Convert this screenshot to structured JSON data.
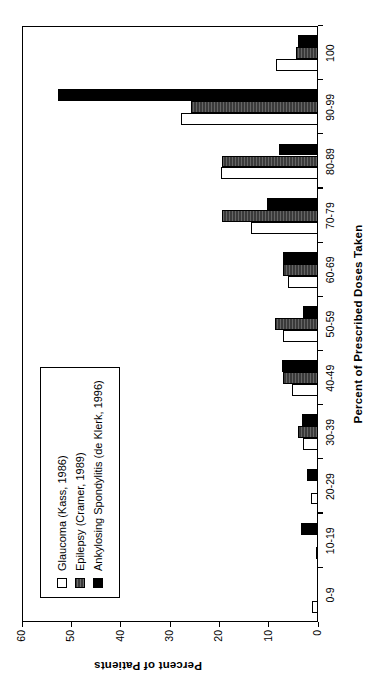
{
  "chart_data": {
    "type": "bar",
    "title": "",
    "xlabel": "Percent of Prescribed Doses Taken",
    "ylabel": "Percent of Patients",
    "ylim": [
      0,
      60
    ],
    "yticks": [
      0,
      10,
      20,
      30,
      40,
      50,
      60
    ],
    "grid": false,
    "legend_position": "inside-upper-left",
    "orientation": "vertical-bars-rotated-90",
    "categories": [
      "0-9",
      "10-19",
      "20-29",
      "30-39",
      "40-49",
      "50-59",
      "60-69",
      "70-79",
      "80-89",
      "90-99",
      "100"
    ],
    "series": [
      {
        "name": "Glaucoma (Kass, 1986)",
        "style": "open-white",
        "color": "#ffffff",
        "values": [
          1.2,
          0.5,
          1.5,
          3.0,
          5.2,
          7.0,
          6.0,
          13.5,
          19.7,
          27.7,
          8.5
        ]
      },
      {
        "name": "Epilepsy (Cramer, 1989)",
        "style": "dark-hatched",
        "color": "#3a3a3a",
        "values": [
          0,
          0,
          0,
          4.0,
          7.0,
          8.7,
          7.0,
          19.5,
          19.5,
          25.7,
          4.5
        ]
      },
      {
        "name": "Ankylosing Spondylitis (de Klerk, 1996)",
        "style": "solid-black",
        "color": "#000000",
        "values": [
          0,
          3.5,
          2.3,
          3.3,
          7.2,
          3.0,
          7.0,
          10.3,
          8.0,
          52.8,
          4.0
        ]
      }
    ]
  },
  "axes": {
    "y_tick_labels": [
      "0",
      "10",
      "20",
      "30",
      "40",
      "50",
      "60"
    ],
    "y_axis_title": "Percent of Patients",
    "x_axis_title": "Percent of Prescribed Doses Taken",
    "x_tick_labels": [
      "0-9",
      "10-19",
      "20-29",
      "30-39",
      "40-49",
      "50-59",
      "60-69",
      "70-79",
      "80-89",
      "90-99",
      "100"
    ]
  },
  "legend": {
    "items": [
      {
        "label": "Glaucoma (Kass, 1986)"
      },
      {
        "label": "Epilepsy (Cramer, 1989)"
      },
      {
        "label": "Ankylosing Spondylitis (de Klerk, 1996)"
      }
    ]
  }
}
